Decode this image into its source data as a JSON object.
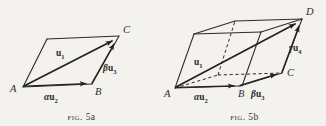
{
  "plate": {
    "background_color": "#f3f2ef",
    "ink_color": "#2e2b27",
    "figure_count": 2
  },
  "figures": [
    {
      "id": "fig-5a",
      "caption_prefix": "Fig.",
      "caption_number": "5a",
      "caption_full": "Fig. 5a",
      "shape": "parallelogram",
      "description": "Planar parallelogram ABCD with resultant vector u1 drawn along the diagonal from A to C, and component vectors alpha*u2 along AB and beta*u3 along BC.",
      "vertices": [
        {
          "name": "A",
          "label": "A"
        },
        {
          "name": "B",
          "label": "B"
        },
        {
          "name": "C",
          "label": "C"
        }
      ],
      "vectors": [
        {
          "name": "resultant",
          "greek": "",
          "base": "u",
          "subscript": "1",
          "label": "u₁",
          "from": "A",
          "to": "C"
        },
        {
          "name": "component-alpha",
          "greek": "α",
          "base": "u",
          "subscript": "2",
          "label": "αu₂",
          "from": "A",
          "to": "B"
        },
        {
          "name": "component-beta",
          "greek": "β",
          "base": "u",
          "subscript": "3",
          "label": "βu₃",
          "from": "B",
          "to": "C"
        }
      ]
    },
    {
      "id": "fig-5b",
      "caption_prefix": "Fig.",
      "caption_number": "5b",
      "caption_full": "Fig. 5b",
      "shape": "parallelepiped",
      "description": "Three-dimensional parallelepiped with resultant vector u1 drawn along the body diagonal from A to D, and component vectors alpha*u2 along AB, beta*u3 along BC, and gamma*u4 along CD. Hidden edges drawn dashed.",
      "vertices": [
        {
          "name": "A",
          "label": "A"
        },
        {
          "name": "B",
          "label": "B"
        },
        {
          "name": "C",
          "label": "C"
        },
        {
          "name": "D",
          "label": "D"
        }
      ],
      "vectors": [
        {
          "name": "resultant",
          "greek": "",
          "base": "u",
          "subscript": "1",
          "label": "u₁",
          "from": "A",
          "to": "D"
        },
        {
          "name": "component-alpha",
          "greek": "α",
          "base": "u",
          "subscript": "2",
          "label": "αu₂",
          "from": "A",
          "to": "B"
        },
        {
          "name": "component-beta",
          "greek": "β",
          "base": "u",
          "subscript": "3",
          "label": "βu₃",
          "from": "B",
          "to": "C"
        },
        {
          "name": "component-gamma",
          "greek": "γ",
          "base": "u",
          "subscript": "4",
          "label": "γu₄",
          "from": "C",
          "to": "D"
        }
      ]
    }
  ],
  "glyphs": {
    "alpha": "α",
    "beta": "β",
    "gamma": "γ",
    "u": "u",
    "sub1": "1",
    "sub2": "2",
    "sub3": "3",
    "sub4": "4"
  }
}
